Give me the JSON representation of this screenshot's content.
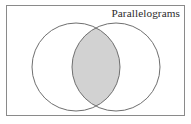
{
  "figure": {
    "kind": "venn-diagram",
    "title": "Parallelograms",
    "frame": {
      "x": 6.5,
      "y": 5.5,
      "width": 178,
      "height": 110,
      "stroke_color": "#8a8a8a",
      "fill_color": "#ffffff",
      "stroke_width": 1
    },
    "sets": [
      {
        "name": "left-set",
        "label": "",
        "cx": 76,
        "cy": 67,
        "r": 44,
        "stroke_color": "#6f6f6f",
        "fill_color": "#ffffff"
      },
      {
        "name": "right-set",
        "label": "",
        "cx": 116,
        "cy": 67,
        "r": 44,
        "stroke_color": "#6f6f6f",
        "fill_color": "#ffffff"
      }
    ],
    "intersection": {
      "name": "intersection-region",
      "label": "",
      "shaded": true,
      "fill_color": "#d2d2d2",
      "stroke_color": "#6f6f6f"
    },
    "title_position": {
      "x": 180,
      "y": 17,
      "anchor": "end"
    }
  }
}
